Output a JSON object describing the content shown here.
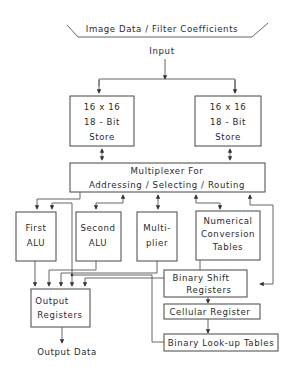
{
  "header": {
    "banner": "Image Data / Filter Coefficients",
    "input_label": "Input"
  },
  "stores": {
    "left": {
      "line1": "16 x 16",
      "line2": "18 - Bit",
      "line3": "Store"
    },
    "right": {
      "line1": "16 x 16",
      "line2": "18 - Bit",
      "line3": "Store"
    }
  },
  "multiplexer": {
    "line1": "Multiplexer For",
    "line2": "Addressing / Selecting / Routing"
  },
  "units": {
    "first_alu": {
      "line1": "First",
      "line2": "ALU"
    },
    "second_alu": {
      "line1": "Second",
      "line2": "ALU"
    },
    "multiplier": {
      "line1": "Multi-",
      "line2": "plier"
    },
    "numerical_conversion": {
      "line1": "Numerical",
      "line2": "Conversion",
      "line3": "Tables"
    }
  },
  "output_registers": {
    "line1": "Output",
    "line2": "Registers"
  },
  "binary_shift": {
    "line1": "Binary Shift",
    "line2": "Registers"
  },
  "cellular_register": {
    "label": "Cellular Register"
  },
  "binary_lookup": {
    "label": "Binary Look-up Tables"
  },
  "footer": {
    "output_label": "Output Data"
  },
  "colors": {
    "line": "#444444",
    "text": "#2a2a2a",
    "background": "#ffffff"
  }
}
